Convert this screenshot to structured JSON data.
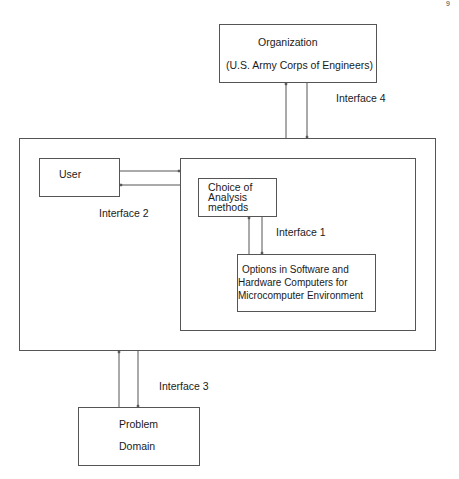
{
  "page": {
    "marker": "9"
  },
  "diagram": {
    "organization": {
      "line1": "Organization",
      "line2": "(U.S. Army Corps of Engineers)"
    },
    "user": {
      "label": "User"
    },
    "choice": {
      "line1": "Choice of",
      "line2": "Analysis",
      "line3": "methods"
    },
    "options": {
      "line1": "Options in Software and",
      "line2": "Hardware Computers for",
      "line3": "Microcomputer Environment"
    },
    "problem": {
      "line1": "Problem",
      "line2": "Domain"
    },
    "interfaces": {
      "i1": "Interface 1",
      "i2": "Interface 2",
      "i3": "Interface 3",
      "i4": "Interface 4"
    }
  }
}
